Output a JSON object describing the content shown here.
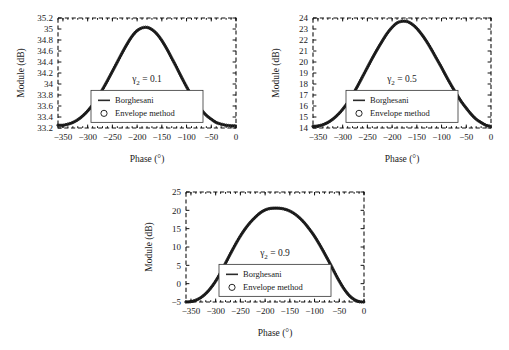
{
  "figure": {
    "panel_count": 3,
    "background": "#ffffff",
    "line_color": "#2a2a2a",
    "axis_color": "#111111"
  },
  "chart_data": [
    {
      "type": "line",
      "title": "",
      "annotation": "γ2 = 0.1",
      "annotation_symbol": "γ",
      "annotation_subscript": "2",
      "annotation_value": "= 0.1",
      "gamma2": 0.1,
      "xlabel": "Phase (°)",
      "ylabel": "Module (dB)",
      "xlim": [
        -360,
        0
      ],
      "ylim": [
        33.2,
        35.2
      ],
      "xticks": [
        -350,
        -300,
        -250,
        -200,
        -150,
        -100,
        -50,
        0
      ],
      "xticklabels": [
        "−350",
        "−300",
        "−250",
        "−200",
        "−150",
        "−100",
        "−50",
        "0"
      ],
      "yticks": [
        33.2,
        33.4,
        33.6,
        33.8,
        34,
        34.2,
        34.4,
        34.6,
        34.8,
        35,
        35.2
      ],
      "yticklabels": [
        "33.2",
        "33.4",
        "33.6",
        "33.8",
        "34",
        "34.2",
        "34.4",
        "34.6",
        "34.8",
        "35",
        "35.2"
      ],
      "grid": false,
      "legend_position": "center-lower",
      "peak_x": -177,
      "peak_y": 35.03,
      "baseline_y": 33.25,
      "series": [
        {
          "name": "Borghesani",
          "marker": "line",
          "x": [
            -360,
            -350,
            -340,
            -330,
            -320,
            -310,
            -300,
            -290,
            -280,
            -270,
            -260,
            -250,
            -240,
            -230,
            -220,
            -210,
            -200,
            -190,
            -180,
            -170,
            -160,
            -150,
            -140,
            -130,
            -120,
            -110,
            -100,
            -90,
            -80,
            -70,
            -60,
            -50,
            -40,
            -30,
            -20,
            -10,
            0
          ],
          "y": [
            33.25,
            33.25,
            33.27,
            33.3,
            33.35,
            33.42,
            33.51,
            33.62,
            33.75,
            33.9,
            34.06,
            34.23,
            34.4,
            34.57,
            34.73,
            34.87,
            34.97,
            35.02,
            35.03,
            34.99,
            34.91,
            34.79,
            34.64,
            34.47,
            34.3,
            34.12,
            33.95,
            33.79,
            33.65,
            33.53,
            33.43,
            33.36,
            33.3,
            33.27,
            33.25,
            33.24,
            33.24
          ]
        },
        {
          "name": "Envelope method",
          "marker": "circle",
          "x": [
            -360,
            -350,
            -340,
            -330,
            -320,
            -310,
            -300,
            -290,
            -280,
            -270,
            -260,
            -250,
            -240,
            -230,
            -220,
            -210,
            -200,
            -190,
            -180,
            -170,
            -160,
            -150,
            -140,
            -130,
            -120,
            -110,
            -100,
            -90,
            -80,
            -70,
            -60,
            -50,
            -40,
            -30,
            -20,
            -10,
            0
          ],
          "y": [
            33.25,
            33.25,
            33.27,
            33.3,
            33.35,
            33.42,
            33.51,
            33.62,
            33.75,
            33.9,
            34.06,
            34.23,
            34.4,
            34.57,
            34.73,
            34.87,
            34.97,
            35.02,
            35.03,
            34.99,
            34.91,
            34.79,
            34.64,
            34.47,
            34.3,
            34.12,
            33.95,
            33.79,
            33.65,
            33.53,
            33.43,
            33.36,
            33.3,
            33.27,
            33.25,
            33.24,
            33.24
          ]
        }
      ]
    },
    {
      "type": "line",
      "title": "",
      "annotation": "γ2 = 0.5",
      "annotation_symbol": "γ",
      "annotation_subscript": "2",
      "annotation_value": "= 0.5",
      "gamma2": 0.5,
      "xlabel": "Phase (°)",
      "ylabel": "Module (dB)",
      "xlim": [
        -360,
        0
      ],
      "ylim": [
        14,
        24
      ],
      "xticks": [
        -350,
        -300,
        -250,
        -200,
        -150,
        -100,
        -50,
        0
      ],
      "xticklabels": [
        "−350",
        "−300",
        "−250",
        "−200",
        "−150",
        "−100",
        "−50",
        "0"
      ],
      "yticks": [
        14,
        15,
        16,
        17,
        18,
        19,
        20,
        21,
        22,
        23,
        24
      ],
      "yticklabels": [
        "14",
        "15",
        "16",
        "17",
        "18",
        "19",
        "20",
        "21",
        "22",
        "23",
        "24"
      ],
      "grid": false,
      "legend_position": "center-lower",
      "peak_x": -177,
      "peak_y": 23.7,
      "baseline_y": 14.15,
      "series": [
        {
          "name": "Borghesani",
          "marker": "line",
          "x": [
            -360,
            -350,
            -340,
            -330,
            -320,
            -310,
            -300,
            -290,
            -280,
            -270,
            -260,
            -250,
            -240,
            -230,
            -220,
            -210,
            -200,
            -190,
            -180,
            -170,
            -160,
            -150,
            -140,
            -130,
            -120,
            -110,
            -100,
            -90,
            -80,
            -70,
            -60,
            -50,
            -40,
            -30,
            -20,
            -10,
            0
          ],
          "y": [
            14.15,
            14.18,
            14.3,
            14.5,
            14.8,
            15.2,
            15.7,
            16.3,
            17.0,
            17.8,
            18.65,
            19.5,
            20.35,
            21.15,
            21.9,
            22.6,
            23.15,
            23.55,
            23.7,
            23.68,
            23.45,
            23.05,
            22.5,
            21.85,
            21.1,
            20.3,
            19.5,
            18.65,
            17.85,
            17.1,
            16.4,
            15.8,
            15.25,
            14.8,
            14.5,
            14.25,
            14.15
          ]
        },
        {
          "name": "Envelope method",
          "marker": "circle",
          "x": [
            -360,
            -350,
            -340,
            -330,
            -320,
            -310,
            -300,
            -290,
            -280,
            -270,
            -260,
            -250,
            -240,
            -230,
            -220,
            -210,
            -200,
            -190,
            -180,
            -170,
            -160,
            -150,
            -140,
            -130,
            -120,
            -110,
            -100,
            -90,
            -80,
            -70,
            -60,
            -50,
            -40,
            -30,
            -20,
            -10,
            0
          ],
          "y": [
            14.15,
            14.18,
            14.3,
            14.5,
            14.8,
            15.2,
            15.7,
            16.3,
            17.0,
            17.8,
            18.65,
            19.5,
            20.35,
            21.15,
            21.9,
            22.6,
            23.15,
            23.55,
            23.7,
            23.68,
            23.45,
            23.05,
            22.5,
            21.85,
            21.1,
            20.3,
            19.5,
            18.65,
            17.85,
            17.1,
            16.4,
            15.8,
            15.25,
            14.8,
            14.5,
            14.25,
            14.15
          ]
        }
      ]
    },
    {
      "type": "line",
      "title": "",
      "annotation": "γ2 = 0.9",
      "annotation_symbol": "γ",
      "annotation_subscript": "2",
      "annotation_value": "= 0.9",
      "gamma2": 0.9,
      "xlabel": "Phase (°)",
      "ylabel": "Module (dB)",
      "xlim": [
        -360,
        0
      ],
      "ylim": [
        -5,
        25
      ],
      "xticks": [
        -350,
        -300,
        -250,
        -200,
        -150,
        -100,
        -50,
        0
      ],
      "xticklabels": [
        "−350",
        "−300",
        "−250",
        "−200",
        "−150",
        "−100",
        "−50",
        "0"
      ],
      "yticks": [
        -5,
        0,
        5,
        10,
        15,
        20,
        25
      ],
      "yticklabels": [
        "−5",
        "0",
        "5",
        "10",
        "15",
        "20",
        "25"
      ],
      "grid": false,
      "legend_position": "center-lower",
      "peak_x": -173,
      "peak_y": 20.6,
      "baseline_y": -5,
      "series": [
        {
          "name": "Borghesani",
          "marker": "line",
          "x": [
            -360,
            -350,
            -340,
            -330,
            -320,
            -310,
            -300,
            -290,
            -280,
            -270,
            -260,
            -250,
            -240,
            -230,
            -220,
            -210,
            -200,
            -190,
            -180,
            -170,
            -160,
            -150,
            -140,
            -130,
            -120,
            -110,
            -100,
            -90,
            -80,
            -70,
            -60,
            -50,
            -40,
            -30,
            -20,
            -10,
            0
          ],
          "y": [
            -5.0,
            -4.9,
            -4.5,
            -3.8,
            -2.7,
            -1.2,
            0.7,
            3.0,
            5.6,
            8.2,
            10.7,
            13.0,
            15.0,
            16.7,
            18.1,
            19.3,
            20.1,
            20.5,
            20.6,
            20.55,
            20.3,
            19.8,
            19.0,
            17.9,
            16.5,
            14.8,
            12.9,
            10.7,
            8.3,
            5.8,
            3.2,
            0.7,
            -1.5,
            -3.2,
            -4.3,
            -4.9,
            -5.0
          ]
        },
        {
          "name": "Envelope method",
          "marker": "circle",
          "x": [
            -360,
            -350,
            -340,
            -330,
            -320,
            -310,
            -300,
            -290,
            -280,
            -270,
            -260,
            -250,
            -240,
            -230,
            -220,
            -210,
            -200,
            -190,
            -180,
            -170,
            -160,
            -150,
            -140,
            -130,
            -120,
            -110,
            -100,
            -90,
            -80,
            -70,
            -60,
            -50,
            -40,
            -30,
            -20,
            -10,
            0
          ],
          "y": [
            -5.0,
            -4.9,
            -4.5,
            -3.8,
            -2.7,
            -1.2,
            0.7,
            3.0,
            5.6,
            8.2,
            10.7,
            13.0,
            15.0,
            16.7,
            18.1,
            19.3,
            20.1,
            20.5,
            20.6,
            20.55,
            20.3,
            19.8,
            19.0,
            17.9,
            16.5,
            14.8,
            12.9,
            10.7,
            8.3,
            5.8,
            3.2,
            0.7,
            -1.5,
            -3.2,
            -4.3,
            -4.9,
            -5.0
          ]
        }
      ]
    }
  ],
  "legend": {
    "entries": [
      {
        "label": "Borghesani",
        "marker": "line"
      },
      {
        "label": "Envelope method",
        "marker": "circle"
      }
    ]
  }
}
